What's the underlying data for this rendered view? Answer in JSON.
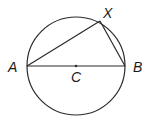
{
  "diagram": {
    "title": "",
    "circle": {
      "cx": 76,
      "cy": 66,
      "r": 49,
      "stroke": "#2a2a2a"
    },
    "points": {
      "A": {
        "label": "A",
        "x": 27,
        "y": 66
      },
      "B": {
        "label": "B",
        "x": 125,
        "y": 66
      },
      "C": {
        "label": "C",
        "x": 76,
        "y": 66
      },
      "X": {
        "label": "X",
        "x": 100,
        "y": 21
      }
    },
    "segments": [
      [
        "A",
        "B"
      ],
      [
        "A",
        "X"
      ],
      [
        "X",
        "B"
      ]
    ],
    "labels": {
      "A": "A",
      "B": "B",
      "C": "C",
      "X": "X"
    }
  }
}
